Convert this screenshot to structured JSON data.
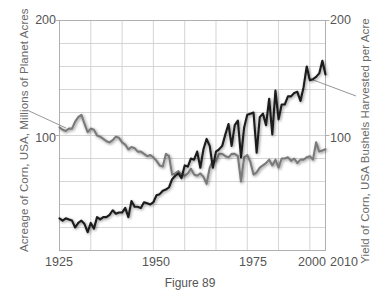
{
  "figure": {
    "caption": "Figure 89"
  },
  "axes": {
    "left": {
      "title": "Acreage of Corn, USA, Millions of Planet Acres",
      "ticks": [
        "200",
        "100"
      ],
      "tick_values": [
        200,
        100
      ],
      "range": [
        0,
        200
      ]
    },
    "right": {
      "title": "Yield of Corn, USA Bushels Harvested per Acre",
      "ticks": [
        "200",
        "100"
      ],
      "tick_values": [
        200,
        100
      ],
      "range": [
        0,
        200
      ]
    },
    "bottom": {
      "ticks": [
        "1925",
        "1950",
        "1975",
        "2000",
        "2010"
      ],
      "tick_values": [
        1925,
        1950,
        1975,
        2000,
        2010
      ],
      "range": [
        1925,
        2010
      ]
    }
  },
  "colors": {
    "acreage_series": "#7a7a7a",
    "yield_series": "#1a1a1a",
    "gridline": "#d0d0d0",
    "axis": "#b0b0b0",
    "text": "#555555",
    "title_text": "#6a6a6a",
    "background": "#ffffff",
    "leader_line": "#8a8a8a"
  },
  "annotations": {
    "left_leader_label": "acreage-leader-line",
    "right_leader_label": "yield-leader-line"
  },
  "chart_data": {
    "type": "line",
    "title": "Figure 89",
    "xlabel": "",
    "ylabel": "Acreage of Corn, USA, Millions of Planet Acres",
    "ylabel_right": "Yield of Corn, USA Bushels Harvested per Acre",
    "xlim": [
      1925,
      2010
    ],
    "ylim": [
      0,
      200
    ],
    "grid": true,
    "legend": "none",
    "x": [
      1925,
      1926,
      1927,
      1928,
      1929,
      1930,
      1931,
      1932,
      1933,
      1934,
      1935,
      1936,
      1937,
      1938,
      1939,
      1940,
      1941,
      1942,
      1943,
      1944,
      1945,
      1946,
      1947,
      1948,
      1949,
      1950,
      1951,
      1952,
      1953,
      1954,
      1955,
      1956,
      1957,
      1958,
      1959,
      1960,
      1961,
      1962,
      1963,
      1964,
      1965,
      1966,
      1967,
      1968,
      1969,
      1970,
      1971,
      1972,
      1973,
      1974,
      1975,
      1976,
      1977,
      1978,
      1979,
      1980,
      1981,
      1982,
      1983,
      1984,
      1985,
      1986,
      1987,
      1988,
      1989,
      1990,
      1991,
      1992,
      1993,
      1994,
      1995,
      1996,
      1997,
      1998,
      1999,
      2000,
      2001,
      2002,
      2003,
      2004,
      2005,
      2006,
      2007,
      2008,
      2009,
      2010
    ],
    "series": [
      {
        "name": "Acreage of Corn, USA, Millions of Planted Acres",
        "color": "#7a7a7a",
        "axis": "left",
        "units": "million acres",
        "values": [
          107,
          105,
          104,
          106,
          106,
          112,
          116,
          118,
          110,
          103,
          106,
          105,
          100,
          99,
          97,
          95,
          94,
          96,
          99,
          98,
          94,
          92,
          88,
          90,
          89,
          86,
          86,
          84,
          82,
          83,
          81,
          78,
          74,
          73,
          84,
          82,
          66,
          67,
          69,
          66,
          65,
          67,
          71,
          66,
          65,
          67,
          64,
          58,
          72,
          78,
          78,
          84,
          84,
          82,
          81,
          84,
          84,
          82,
          60,
          81,
          83,
          77,
          66,
          68,
          72,
          74,
          76,
          79,
          74,
          79,
          72,
          80,
          80,
          81,
          78,
          80,
          76,
          79,
          79,
          81,
          82,
          79,
          94,
          86,
          87,
          88
        ]
      },
      {
        "name": "Yield of Corn, USA Bushels Harvested per Acre",
        "color": "#1a1a1a",
        "axis": "right",
        "units": "bushels per acre",
        "values": [
          28,
          26,
          28,
          27,
          26,
          20,
          24,
          26,
          23,
          16,
          24,
          19,
          29,
          27,
          29,
          29,
          31,
          35,
          32,
          33,
          33,
          37,
          29,
          43,
          38,
          38,
          37,
          42,
          41,
          40,
          42,
          48,
          49,
          52,
          53,
          55,
          62,
          65,
          67,
          63,
          74,
          73,
          80,
          79,
          86,
          72,
          88,
          97,
          91,
          72,
          86,
          88,
          91,
          101,
          110,
          91,
          109,
          113,
          81,
          107,
          118,
          119,
          120,
          85,
          116,
          119,
          109,
          132,
          101,
          139,
          114,
          127,
          127,
          134,
          134,
          137,
          138,
          130,
          142,
          160,
          148,
          149,
          151,
          154,
          165,
          153
        ]
      }
    ]
  }
}
